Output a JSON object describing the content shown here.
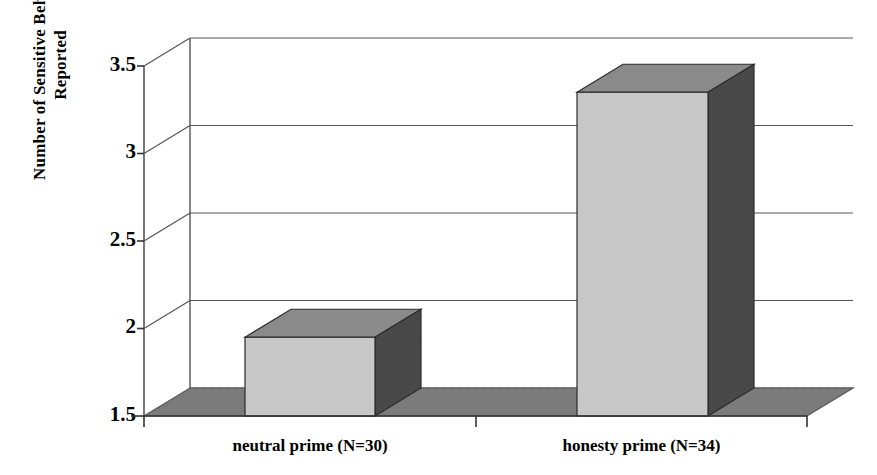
{
  "chart_data": {
    "type": "bar",
    "title": "",
    "subtitle": "",
    "xlabel": "",
    "ylabel": "Number of Sensitive Behaviors Reported",
    "ylabel_lines": [
      "Number of Sensitive Behaviors",
      "Reported"
    ],
    "categories": [
      "neutral prime (N=30)",
      "honesty prime (N=34)"
    ],
    "values": [
      1.95,
      3.35
    ],
    "ylim": [
      1.5,
      3.5
    ],
    "yticks": [
      1.5,
      2,
      2.5,
      3,
      3.5
    ],
    "ytick_labels": [
      "1.5",
      "2",
      "2.5",
      "3",
      "3.5"
    ],
    "grid": true,
    "legend": "none",
    "style": "3d-column",
    "colors": {
      "bar_front": "#c9c9c9",
      "bar_top": "#8c8c8c",
      "bar_side": "#4a4a4a",
      "floor": "#7d7d7d",
      "wall": "#ffffff",
      "axis": "#555555",
      "text": "#000000"
    }
  },
  "axis": {
    "ytick_1": "3.5",
    "ytick_2": "3",
    "ytick_3": "2.5",
    "ytick_4": "2",
    "ytick_5": "1.5"
  },
  "series_label": {
    "bar_1": "neutral prime (N=30)",
    "bar_2": "honesty prime (N=34)"
  }
}
